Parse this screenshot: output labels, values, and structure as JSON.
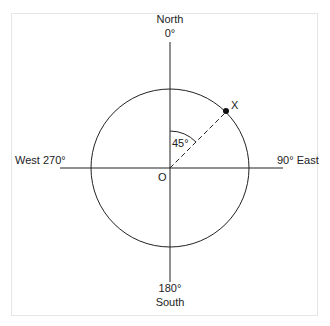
{
  "diagram": {
    "type": "compass-bearing",
    "labels": {
      "north": "North",
      "north_deg": "0°",
      "south": "South",
      "south_deg": "180°",
      "east": "90° East",
      "west": "West 270°",
      "origin": "O",
      "point": "X",
      "angle": "45°"
    },
    "bearing_degrees": 45,
    "colors": {
      "line": "#222222",
      "frame": "#e6e6e6",
      "background": "#ffffff"
    }
  }
}
